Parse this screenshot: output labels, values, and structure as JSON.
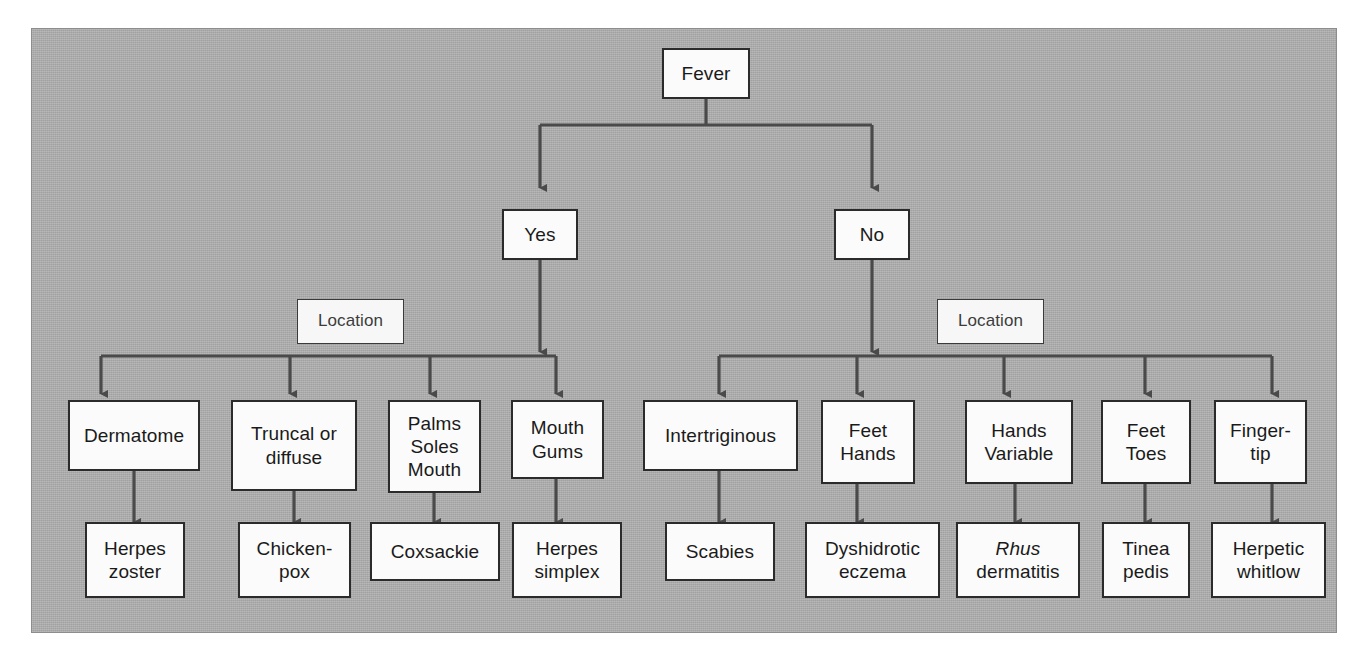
{
  "figure": {
    "background_color": "#a9a9a9",
    "box_fill_color": "#fbfbfb",
    "box_border_color": "#2b2b2b",
    "connector_color": "#4a4a4a"
  },
  "root": {
    "label": "Fever"
  },
  "branches": [
    {
      "id": "yes",
      "label": "Yes"
    },
    {
      "id": "no",
      "label": "No"
    }
  ],
  "location_labels": [
    {
      "id": "location-left",
      "label": "Location"
    },
    {
      "id": "location-right",
      "label": "Location"
    }
  ],
  "yes_branch": {
    "criteria": [
      {
        "id": "dermatome",
        "label": "Dermatome"
      },
      {
        "id": "truncal-diffuse",
        "label": "Truncal or\ndiffuse"
      },
      {
        "id": "palms-soles-mouth",
        "label": "Palms\nSoles\nMouth"
      },
      {
        "id": "mouth-gums",
        "label": "Mouth\nGums"
      }
    ],
    "diagnoses": [
      {
        "id": "herpes-zoster",
        "label": "Herpes\nzoster"
      },
      {
        "id": "chickenpox",
        "label": "Chicken-\npox"
      },
      {
        "id": "coxsackie",
        "label": "Coxsackie"
      },
      {
        "id": "herpes-simplex",
        "label": "Herpes\nsimplex"
      }
    ]
  },
  "no_branch": {
    "criteria": [
      {
        "id": "intertriginous",
        "label": "Intertriginous"
      },
      {
        "id": "feet-hands",
        "label": "Feet\nHands"
      },
      {
        "id": "hands-variable",
        "label": "Hands\nVariable"
      },
      {
        "id": "feet-toes",
        "label": "Feet\nToes"
      },
      {
        "id": "fingertip",
        "label": "Finger-\ntip"
      }
    ],
    "diagnoses": [
      {
        "id": "scabies",
        "label": "Scabies"
      },
      {
        "id": "dyshidrotic-eczema",
        "label": "Dyshidrotic\neczema"
      },
      {
        "id": "rhus-dermatitis",
        "label_italic": "Rhus",
        "label_rest": "dermatitis"
      },
      {
        "id": "tinea-pedis",
        "label": "Tinea\npedis"
      },
      {
        "id": "herpetic-whitlow",
        "label": "Herpetic\nwhitlow"
      }
    ]
  }
}
